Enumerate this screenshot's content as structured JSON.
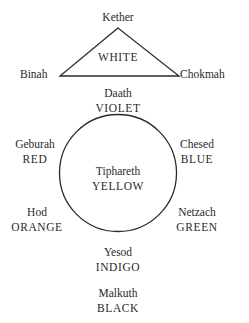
{
  "diagram": {
    "type": "sephirot-color-correspondence",
    "triangle": {
      "color_label": "WHITE",
      "vertices": [
        {
          "name": "Kether",
          "position": "apex"
        },
        {
          "name": "Binah",
          "position": "left"
        },
        {
          "name": "Chokmah",
          "position": "right"
        }
      ]
    },
    "nodes": [
      {
        "id": "kether",
        "name": "Kether",
        "color": ""
      },
      {
        "id": "binah",
        "name": "Binah",
        "color": ""
      },
      {
        "id": "chokmah",
        "name": "Chokmah",
        "color": ""
      },
      {
        "id": "daath",
        "name": "Daath",
        "color": "VIOLET"
      },
      {
        "id": "geburah",
        "name": "Geburah",
        "color": "RED"
      },
      {
        "id": "chesed",
        "name": "Chesed",
        "color": "BLUE"
      },
      {
        "id": "tiphareth",
        "name": "Tiphareth",
        "color": "YELLOW"
      },
      {
        "id": "hod",
        "name": "Hod",
        "color": "ORANGE"
      },
      {
        "id": "netzach",
        "name": "Netzach",
        "color": "GREEN"
      },
      {
        "id": "yesod",
        "name": "Yesod",
        "color": "INDIGO"
      },
      {
        "id": "malkuth",
        "name": "Malkuth",
        "color": "BLACK"
      }
    ],
    "edges": [
      {
        "from": "kether",
        "to": "binah"
      },
      {
        "from": "kether",
        "to": "chokmah"
      },
      {
        "from": "binah",
        "to": "chokmah"
      }
    ],
    "circle": {
      "center_node": "tiphareth",
      "surrounding": [
        "geburah",
        "chesed",
        "hod",
        "netzach"
      ]
    }
  }
}
